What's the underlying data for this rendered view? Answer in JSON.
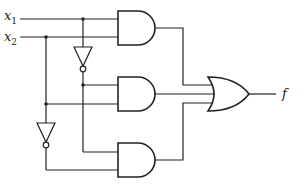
{
  "diagram": {
    "type": "logic-circuit",
    "inputs": [
      {
        "name": "x",
        "sub": "1",
        "y": 16
      },
      {
        "name": "x",
        "sub": "2",
        "y": 37
      }
    ],
    "output": {
      "label": "f"
    },
    "gates": [
      {
        "id": "not1",
        "type": "NOT",
        "input": "x1"
      },
      {
        "id": "not2",
        "type": "NOT",
        "input": "x2"
      },
      {
        "id": "and1",
        "type": "AND",
        "inputs": [
          "x1",
          "x2"
        ]
      },
      {
        "id": "and2",
        "type": "AND",
        "inputs": [
          "not x1",
          "x2"
        ]
      },
      {
        "id": "and3",
        "type": "AND",
        "inputs": [
          "x1",
          "not x2"
        ]
      },
      {
        "id": "or1",
        "type": "OR",
        "inputs": [
          "and1",
          "and2",
          "and3"
        ],
        "output": "f"
      }
    ],
    "stroke_color": "#222222"
  }
}
